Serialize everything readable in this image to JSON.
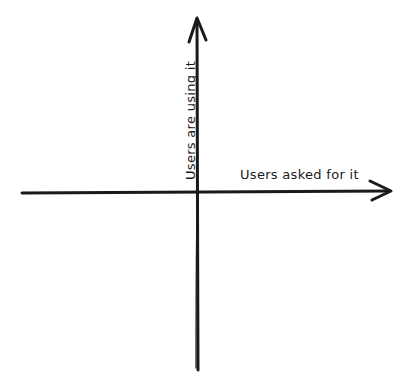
{
  "diagram": {
    "type": "quadrant-axes",
    "style": "hand-drawn",
    "stroke_color": "#1a1a1a",
    "background": "#ffffff",
    "x_axis": {
      "label": "Users asked for it",
      "direction": "right",
      "arrowhead": "end"
    },
    "y_axis": {
      "label": "Users are using it",
      "direction": "up",
      "arrowhead": "end"
    }
  }
}
